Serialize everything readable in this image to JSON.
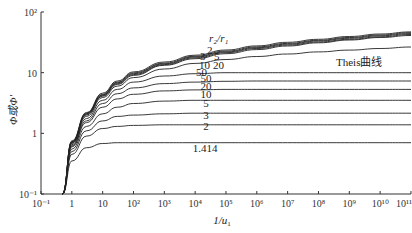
{
  "chart_data": {
    "type": "line",
    "title": "",
    "xlabel": "1/u₁",
    "ylabel": "Φ或Φ'",
    "xscale": "log",
    "yscale": "log",
    "xlim": [
      0.1,
      100000000000.0
    ],
    "ylim": [
      0.1,
      100
    ],
    "grid": false,
    "x_ticks": [
      "10⁻¹",
      "1",
      "10",
      "10²",
      "10³",
      "10⁴",
      "10⁵",
      "10⁶",
      "10⁷",
      "10⁸",
      "10⁹",
      "10¹⁰",
      "10¹¹"
    ],
    "y_ticks": [
      "10⁻¹",
      "1",
      "10",
      "10²"
    ],
    "legend_title": "r₂/r₁",
    "x": [
      0.5,
      1,
      3,
      10,
      30,
      100,
      1000.0,
      10000.0,
      100000.0,
      1000000.0,
      10000000.0,
      100000000.0,
      1000000000.0,
      10000000000.0,
      100000000000.0
    ],
    "series": [
      {
        "name": "1.414",
        "values": [
          0.1,
          0.35,
          0.58,
          0.68,
          0.7,
          0.7,
          0.7,
          0.7,
          0.7,
          0.7,
          0.7,
          0.7,
          0.7,
          0.7,
          0.7
        ]
      },
      {
        "name": "2",
        "values": [
          0.1,
          0.45,
          0.9,
          1.2,
          1.3,
          1.35,
          1.38,
          1.38,
          1.38,
          1.38,
          1.38,
          1.38,
          1.38,
          1.38,
          1.38
        ]
      },
      {
        "name": "3",
        "values": [
          0.1,
          0.5,
          1.1,
          1.6,
          1.9,
          2.0,
          2.1,
          2.15,
          2.15,
          2.15,
          2.15,
          2.15,
          2.15,
          2.15,
          2.15
        ]
      },
      {
        "name": "5",
        "values": [
          0.1,
          0.55,
          1.3,
          2.1,
          2.7,
          3.1,
          3.4,
          3.5,
          3.5,
          3.5,
          3.5,
          3.5,
          3.5,
          3.5,
          3.5
        ]
      },
      {
        "name": "10",
        "values": [
          0.1,
          0.6,
          1.5,
          2.7,
          3.7,
          4.4,
          5.0,
          5.2,
          5.3,
          5.3,
          5.3,
          5.3,
          5.3,
          5.3,
          5.3
        ]
      },
      {
        "name": "20",
        "values": [
          0.1,
          0.62,
          1.6,
          3.1,
          4.5,
          5.6,
          6.6,
          7.0,
          7.2,
          7.3,
          7.3,
          7.3,
          7.3,
          7.3,
          7.3
        ]
      },
      {
        "name": "50",
        "values": [
          0.1,
          0.65,
          1.75,
          3.5,
          5.3,
          7.0,
          8.8,
          9.6,
          10.0,
          10.0,
          10.0,
          10.0,
          10.0,
          10.0,
          10.0
        ]
      },
      {
        "name": "Theis曲线",
        "values": [
          0.1,
          0.68,
          1.9,
          3.9,
          6.0,
          8.3,
          11.5,
          14.2,
          16.5,
          18.5,
          20.3,
          22.0,
          23.5,
          25.0,
          26.5
        ]
      },
      {
        "name": "20 (upper)",
        "values": [
          0.1,
          0.7,
          2.0,
          4.1,
          6.4,
          9.0,
          13.2,
          17.0,
          20.5,
          24.0,
          27.5,
          31.0,
          34.5,
          38.0,
          41.0
        ]
      },
      {
        "name": "10 (upper)",
        "values": [
          0.1,
          0.7,
          2.05,
          4.2,
          6.6,
          9.3,
          13.6,
          17.6,
          21.3,
          25.0,
          28.5,
          32.0,
          35.5,
          39.0,
          42.5
        ]
      },
      {
        "name": "5 (upper)",
        "values": [
          0.1,
          0.72,
          2.1,
          4.3,
          6.8,
          9.6,
          14.0,
          18.2,
          22.0,
          25.8,
          29.5,
          33.2,
          36.8,
          40.5,
          44.0
        ]
      },
      {
        "name": "3 (upper)",
        "values": [
          0.1,
          0.73,
          2.15,
          4.4,
          7.0,
          9.9,
          14.4,
          18.7,
          22.7,
          26.6,
          30.4,
          34.2,
          38.0,
          41.8,
          45.5
        ]
      },
      {
        "name": "2 (upper)",
        "values": [
          0.1,
          0.75,
          2.2,
          4.6,
          7.3,
          10.3,
          15.0,
          19.4,
          23.6,
          27.6,
          31.6,
          35.5,
          39.4,
          43.3,
          47.0
        ]
      }
    ],
    "annotations": [
      "r₂/r₁",
      "2",
      "3",
      "5",
      "10",
      "20",
      "50",
      "50",
      "20",
      "10",
      "5",
      "3",
      "2",
      "1.414",
      "Theis曲线"
    ]
  },
  "labels": {
    "ylabel": "Φ或Φ'",
    "xlabel_main": "1/u",
    "xlabel_sub": "1",
    "legend_title": "r₂/r₁",
    "theis": "Theis曲线",
    "upper": [
      "2",
      "3",
      "5",
      "10",
      "20",
      "50"
    ],
    "lower": [
      "50",
      "20",
      "10",
      "5",
      "3",
      "2",
      "1.414"
    ]
  },
  "ticks": {
    "x": [
      "10⁻¹",
      "1",
      "10",
      "10²",
      "10³",
      "10⁴",
      "10⁵",
      "10⁶",
      "10⁷",
      "10⁸",
      "10⁹",
      "10¹⁰",
      "10¹¹"
    ],
    "y": [
      "10⁻¹",
      "1",
      "10",
      "10²"
    ]
  }
}
